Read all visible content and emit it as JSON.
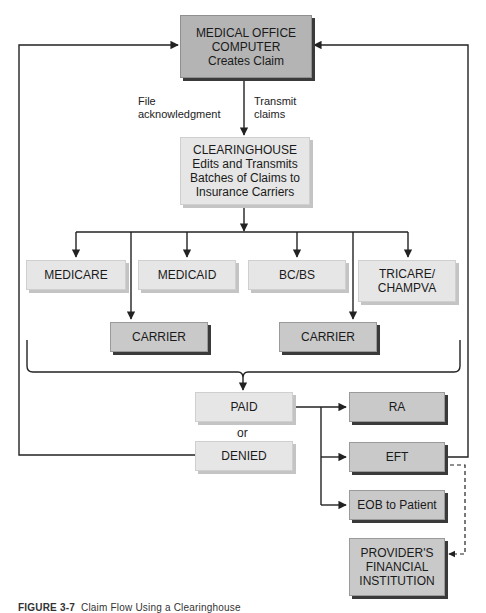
{
  "diagram": {
    "medical_office": {
      "line1": "MEDICAL OFFICE",
      "line2": "COMPUTER",
      "line3": "Creates Claim"
    },
    "edge_labels": {
      "file_ack_1": "File",
      "file_ack_2": "acknowledgment",
      "transmit_1": "Transmit",
      "transmit_2": "claims"
    },
    "clearinghouse": {
      "line1": "CLEARINGHOUSE",
      "line2": "Edits and Transmits",
      "line3": "Batches of Claims to",
      "line4": "Insurance Carriers"
    },
    "payers": [
      {
        "label": "MEDICARE"
      },
      {
        "label": "MEDICAID"
      },
      {
        "label": "BC/BS"
      },
      {
        "line1": "TRICARE/",
        "line2": "CHAMPVA"
      }
    ],
    "carriers": [
      {
        "label": "CARRIER"
      },
      {
        "label": "CARRIER"
      }
    ],
    "outcomes": {
      "paid": "PAID",
      "or": "or",
      "denied": "DENIED"
    },
    "results": {
      "ra": "RA",
      "eft": "EFT",
      "eob": "EOB to Patient",
      "provider_1": "PROVIDER'S",
      "provider_2": "FINANCIAL",
      "provider_3": "INSTITUTION"
    },
    "caption": {
      "figure": "FIGURE 3-7",
      "text": "Claim Flow Using a Clearinghouse"
    },
    "colors": {
      "dark_box": "#b4b4b4",
      "light_box": "#e6e6e6",
      "line": "#222222"
    }
  }
}
